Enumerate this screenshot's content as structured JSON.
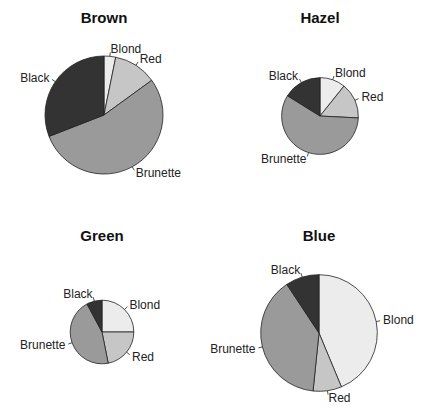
{
  "chart_data": [
    {
      "type": "pie",
      "title": "Brown",
      "categories": [
        "Blond",
        "Red",
        "Brunette",
        "Black"
      ],
      "values": [
        7,
        26,
        119,
        68
      ],
      "total": 220,
      "colors": [
        "#ececec",
        "#c6c6c6",
        "#9a9a9a",
        "#333333"
      ]
    },
    {
      "type": "pie",
      "title": "Hazel",
      "categories": [
        "Blond",
        "Red",
        "Brunette",
        "Black"
      ],
      "values": [
        10,
        14,
        54,
        15
      ],
      "total": 93,
      "colors": [
        "#ececec",
        "#c6c6c6",
        "#9a9a9a",
        "#333333"
      ]
    },
    {
      "type": "pie",
      "title": "Green",
      "categories": [
        "Blond",
        "Red",
        "Brunette",
        "Black"
      ],
      "values": [
        16,
        14,
        29,
        5
      ],
      "total": 64,
      "colors": [
        "#ececec",
        "#c6c6c6",
        "#9a9a9a",
        "#333333"
      ]
    },
    {
      "type": "pie",
      "title": "Blue",
      "categories": [
        "Blond",
        "Red",
        "Brunette",
        "Black"
      ],
      "values": [
        94,
        17,
        84,
        20
      ],
      "total": 215,
      "colors": [
        "#ececec",
        "#c6c6c6",
        "#9a9a9a",
        "#333333"
      ]
    }
  ],
  "notes": {
    "slice_order": "clockwise from 12 o'clock",
    "area_scaling": "pie radius proportional to square root of total"
  }
}
